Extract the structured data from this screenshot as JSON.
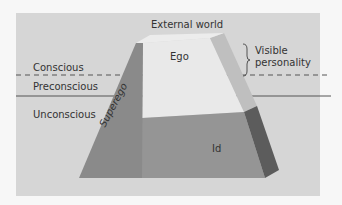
{
  "diagram": {
    "levels": {
      "conscious": "Conscious",
      "preconscious": "Preconscious",
      "unconscious": "Unconscious"
    },
    "parts": {
      "external_world": "External world",
      "ego": "Ego",
      "superego": "Superego",
      "id": "Id"
    },
    "annotation": {
      "line1": "Visible",
      "line2": "personality"
    },
    "colors": {
      "panel": "#d6d6d6",
      "superego": "#8a8a8a",
      "id": "#959595",
      "ego": "#e9e9e9",
      "right_light": "#bfbfbf",
      "right_dark": "#5c5c5c",
      "lines": "#555555"
    }
  }
}
